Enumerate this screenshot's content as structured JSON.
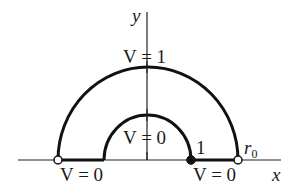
{
  "diagram": {
    "type": "boundary-value-region",
    "axes": {
      "x_label": "x",
      "y_label": "y"
    },
    "outer_arc": {
      "label": "V = 1",
      "radius_label": "r",
      "radius_sub": "0"
    },
    "inner_arc": {
      "label": "V = 0",
      "radius_label": "1"
    },
    "left_boundary_label": "V = 0",
    "right_boundary_label": "V = 0",
    "points": [
      {
        "name": "-r0",
        "style": "open"
      },
      {
        "name": "1",
        "style": "filled"
      },
      {
        "name": "r0",
        "style": "open"
      }
    ],
    "colors": {
      "stroke": "#111111",
      "background": "#ffffff"
    }
  }
}
